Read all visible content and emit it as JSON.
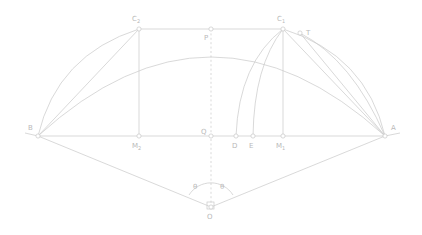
{
  "diagram": {
    "stroke_color": "#c9c9c9",
    "label_color": "#b9b9b9",
    "marker_fill": "#ffffff",
    "width": 422,
    "height": 235,
    "points": [
      {
        "id": "B",
        "label": "B",
        "sub": "",
        "x": 38,
        "y": 136,
        "lx": 28,
        "ly": 130,
        "marker": true
      },
      {
        "id": "A",
        "label": "A",
        "sub": "",
        "x": 385,
        "y": 136,
        "lx": 391,
        "ly": 130,
        "marker": true
      },
      {
        "id": "C2",
        "label": "C",
        "sub": "2",
        "x": 139,
        "y": 29,
        "lx": 132,
        "ly": 21,
        "marker": true
      },
      {
        "id": "C1",
        "label": "C",
        "sub": "1",
        "x": 283,
        "y": 29,
        "lx": 277,
        "ly": 21,
        "marker": true
      },
      {
        "id": "P",
        "label": "P",
        "sub": "",
        "x": 211,
        "y": 29,
        "lx": 204,
        "ly": 40,
        "marker": true
      },
      {
        "id": "T",
        "label": "T",
        "sub": "",
        "x": 300,
        "y": 33,
        "lx": 306,
        "ly": 35,
        "marker": true
      },
      {
        "id": "Q",
        "label": "Q",
        "sub": "",
        "x": 211,
        "y": 136,
        "lx": 201,
        "ly": 134,
        "marker": true
      },
      {
        "id": "M2",
        "label": "M",
        "sub": "2",
        "x": 139,
        "y": 136,
        "lx": 132,
        "ly": 148,
        "marker": true
      },
      {
        "id": "M1",
        "label": "M",
        "sub": "1",
        "x": 283,
        "y": 136,
        "lx": 276,
        "ly": 148,
        "marker": true
      },
      {
        "id": "D",
        "label": "D",
        "sub": "",
        "x": 236,
        "y": 136,
        "lx": 232,
        "ly": 148,
        "marker": true
      },
      {
        "id": "E",
        "label": "E",
        "sub": "",
        "x": 253,
        "y": 136,
        "lx": 249,
        "ly": 148,
        "marker": true
      },
      {
        "id": "O",
        "label": "O",
        "sub": "",
        "x": 211,
        "y": 207,
        "lx": 207,
        "ly": 219,
        "marker": true
      }
    ],
    "angles": [
      {
        "id": "theta-left",
        "label": "θ",
        "lx": 193,
        "ly": 189
      },
      {
        "id": "theta-right",
        "label": "θ",
        "lx": 220,
        "ly": 189
      }
    ],
    "segments": [
      {
        "id": "baseline-BA",
        "x1": 38,
        "y1": 136,
        "x2": 385,
        "y2": 136
      },
      {
        "id": "baseline-left-tail",
        "x1": 25,
        "y1": 133,
        "x2": 38,
        "y2": 136
      },
      {
        "id": "baseline-right-tail",
        "x1": 385,
        "y1": 136,
        "x2": 400,
        "y2": 133
      },
      {
        "id": "chord-C2-C1",
        "x1": 139,
        "y1": 29,
        "x2": 283,
        "y2": 29
      },
      {
        "id": "chord-B-C2",
        "x1": 38,
        "y1": 136,
        "x2": 139,
        "y2": 29
      },
      {
        "id": "chord-A-C1",
        "x1": 385,
        "y1": 136,
        "x2": 283,
        "y2": 29
      },
      {
        "id": "chord-A-T",
        "x1": 385,
        "y1": 136,
        "x2": 300,
        "y2": 33
      },
      {
        "id": "ordinate-C2-M2",
        "x1": 139,
        "y1": 29,
        "x2": 139,
        "y2": 136
      },
      {
        "id": "ordinate-C1-M1",
        "x1": 283,
        "y1": 29,
        "x2": 283,
        "y2": 136
      },
      {
        "id": "radius-O-B",
        "x1": 211,
        "y1": 207,
        "x2": 38,
        "y2": 136
      },
      {
        "id": "radius-O-A",
        "x1": 211,
        "y1": 207,
        "x2": 385,
        "y2": 136
      }
    ],
    "dashed_segments": [
      {
        "id": "axis-P-O",
        "x1": 211,
        "y1": 29,
        "x2": 211,
        "y2": 207
      }
    ],
    "arcs": [
      {
        "id": "arc-major-B-A",
        "d": "M 38 136 Q 211 -22 385 136"
      },
      {
        "id": "arc-B-C2",
        "d": "M 38 136 Q 57 55 139 29"
      },
      {
        "id": "arc-A-C1-outer",
        "d": "M 385 136 Q 366 55 283 29"
      },
      {
        "id": "arc-A-T",
        "d": "M 385 136 Q 352 60 300 33"
      },
      {
        "id": "arc-D-C1",
        "d": "M 236 136 Q 239 63 283 29"
      },
      {
        "id": "arc-E-C1",
        "d": "M 253 136 Q 254 66 283 29"
      }
    ],
    "angle_arc": {
      "id": "angle-arc-at-O",
      "d": "M 189 195 A 26 26 0 0 1 233 195"
    },
    "right_angle_marker": {
      "id": "right-angle-marker-O",
      "x": 207,
      "y": 202,
      "size": 7
    }
  }
}
